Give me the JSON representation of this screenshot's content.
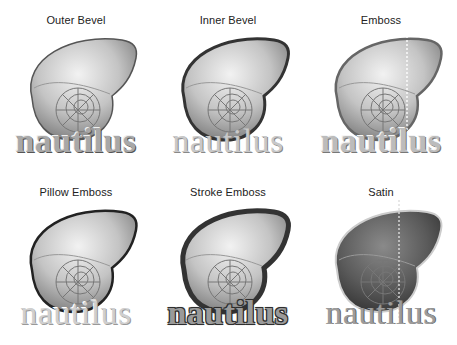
{
  "figure": {
    "panels": [
      {
        "title": "Outer Bevel",
        "word": "nautilus",
        "style": "outer-bevel"
      },
      {
        "title": "Inner Bevel",
        "word": "nautilus",
        "style": "inner-bevel"
      },
      {
        "title": "Emboss",
        "word": "nautilus",
        "style": "emboss"
      },
      {
        "title": "Pillow Emboss",
        "word": "nautilus",
        "style": "pillow-emboss"
      },
      {
        "title": "Stroke Emboss",
        "word": "nautilus",
        "style": "stroke-emboss"
      },
      {
        "title": "Satin",
        "word": "nautilus",
        "style": "satin"
      }
    ],
    "colors": {
      "background": "#ffffff",
      "shell_light": "#e6e6e6",
      "shell_mid": "#a0a0a0",
      "shell_dark": "#3a3a3a",
      "text": "#222222"
    }
  }
}
